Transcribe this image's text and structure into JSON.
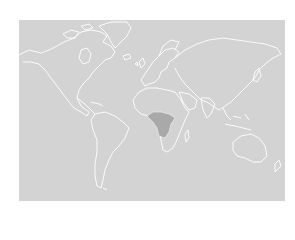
{
  "map": {
    "projection": "world-equirectangular",
    "colors": {
      "page_background": "#ffffff",
      "ocean_and_land": "#d3d3d3",
      "coastline": "#ffffff",
      "highlight_region": "#a9a9a9"
    },
    "highlighted_region": {
      "name": "Central Africa",
      "color": "#a9a9a9"
    },
    "labels": []
  }
}
